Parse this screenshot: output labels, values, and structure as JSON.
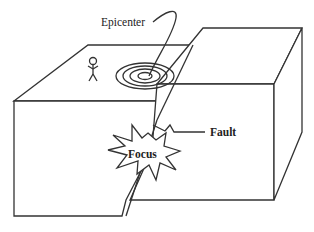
{
  "diagram": {
    "labels": {
      "epicenter": "Epicenter",
      "fault": "Fault",
      "focus": "Focus"
    },
    "colors": {
      "line": "#333333",
      "background": "#ffffff",
      "text": "#222222"
    }
  }
}
